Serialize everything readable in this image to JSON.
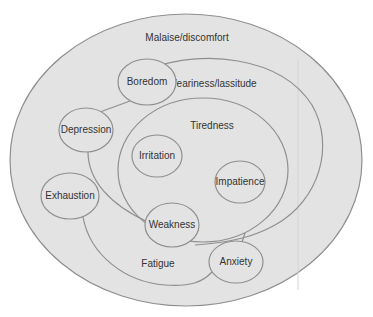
{
  "diagram": {
    "type": "nested-concept-map",
    "regions": {
      "malaise": "Malaise/discomfort",
      "weariness": "Weariness/lassitude",
      "tiredness": "Tiredness",
      "fatigue": "Fatigue"
    },
    "nodes": {
      "boredom": "Boredom",
      "depression": "Depression",
      "irritation": "Irritation",
      "impatience": "Impatience",
      "exhaustion": "Exhaustion",
      "weakness": "Weakness",
      "anxiety": "Anxiety"
    },
    "colors": {
      "fill": "#e3e3e3",
      "stroke": "#8f8f8f",
      "text": "#333333"
    }
  }
}
